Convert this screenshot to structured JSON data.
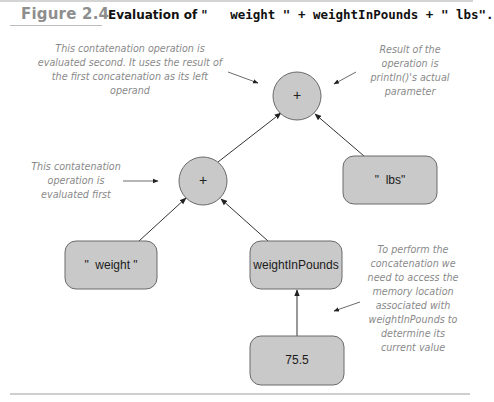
{
  "figure": {
    "number": "Figure 2.4",
    "title_prefix": "Evaluation of \"",
    "title_code": "   weight \" + weightInPounds + \" lbs\"."
  },
  "nodes": {
    "top_operator": {
      "label": "+"
    },
    "inner_operator": {
      "label": "+"
    },
    "weight_literal": {
      "label": "\"  weight \""
    },
    "weight_variable": {
      "label": "weightInPounds"
    },
    "lbs_literal": {
      "label": "\"  lbs\""
    },
    "value": {
      "label": "75.5"
    }
  },
  "annotations": {
    "second_concat": [
      "This contatenation operation is",
      "evaluated second. It uses the result of",
      "the first concatenation as its left",
      "operand"
    ],
    "result": [
      "Result of  the",
      "operation is",
      "println()'s  actual",
      "parameter"
    ],
    "first_concat": [
      "This contatenation",
      "operation is",
      "evaluated first"
    ],
    "memory": [
      "To perform  the",
      "concatenation we",
      "need to access the",
      "memory location",
      "associated with",
      "weightInPounds to",
      "determine  its",
      "current value"
    ]
  },
  "colors": {
    "node_fill": "#c9c9c9",
    "node_stroke": "#6a6a6a",
    "annotation_text": "#8a8a8a",
    "figure_number": "#8e8e8e"
  }
}
